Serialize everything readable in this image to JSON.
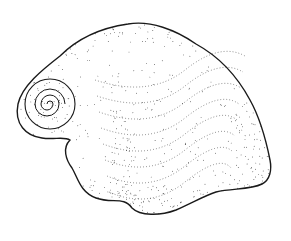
{
  "image": {
    "subject": "stippled illustration of a gastropod shell",
    "style": "pen-and-ink stipple",
    "colors": {
      "background": "#ffffff",
      "ink": "#1a1a1a"
    }
  }
}
